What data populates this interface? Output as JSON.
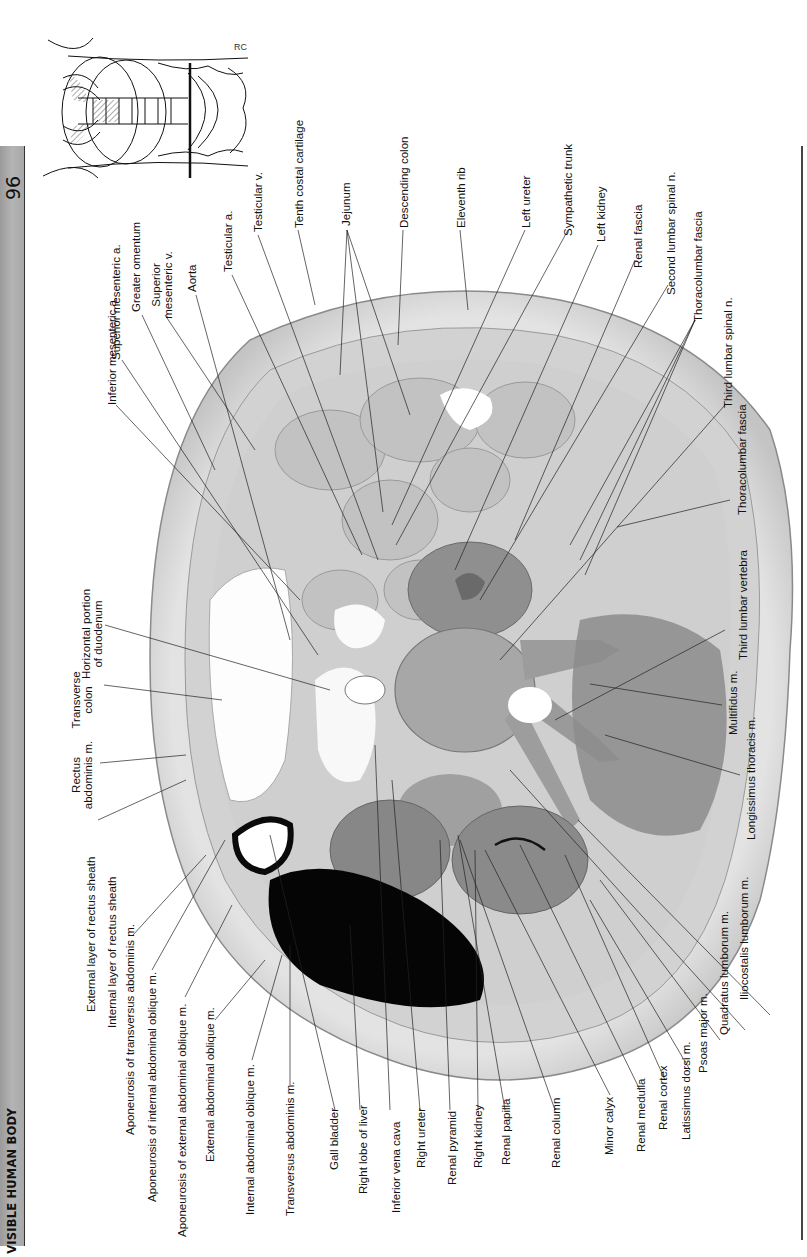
{
  "header": {
    "page_number": "96",
    "running_title": "THE VISIBLE HUMAN BODY"
  },
  "colors": {
    "header_bar": "#a8a8a8",
    "rule": "#444444",
    "tissue_light": "#e4e4e4",
    "tissue_mid": "#9c9c9c",
    "liver": "#050505",
    "text": "#111111"
  },
  "figure": {
    "thumbnail_label": "Orientation diagram: level of section through third lumbar vertebra",
    "thumbnail_initials": "RC",
    "labels_top": [
      "Inferior mesenteric a.",
      "Superior mesenteric a.",
      "Greater omentum",
      "Superior mesenteric v.",
      "Aorta",
      "Testicular a.",
      "Testicular v.",
      "Tenth costal cartilage",
      "Jejunum",
      "Descending colon",
      "Eleventh rib",
      "Left ureter",
      "Sympathetic trunk"
    ],
    "labels_left": [
      "Horizontal portion of duodenum",
      "Transverse colon",
      "Rectus abdominis m.",
      "External layer of rectus sheath",
      "Internal layer of rectus sheath"
    ],
    "labels_bottom": [
      "Aponeurosis of transversus abdominis m.",
      "Aponeurosis of internal abdominal oblique m.",
      "Aponeurosis of external abdominal oblique m.",
      "External abdominal oblique m.",
      "Internal abdominal oblique m.",
      "Transversus abdominis m.",
      "Gall bladder",
      "Right lobe of liver",
      "Inferior vena cava",
      "Right ureter",
      "Renal pyramid",
      "Right kidney",
      "Renal papilla",
      "Renal column",
      "Minor calyx",
      "Renal medulla",
      "Renal cortex",
      "Latissimus dorsi m.",
      "Psoas major m.",
      "Quadratus lumborum m.",
      "Iliocostalis lumborum m."
    ],
    "labels_right": [
      "Left kidney",
      "Renal fascia",
      "Second lumbar spinal n.",
      "Thoracolumbar fascia",
      "Third lumbar spinal n.",
      "Thoracolumbar fascia",
      "Third lumbar vertebra",
      "Multifidus m.",
      "Longissimus thoracis m."
    ]
  }
}
